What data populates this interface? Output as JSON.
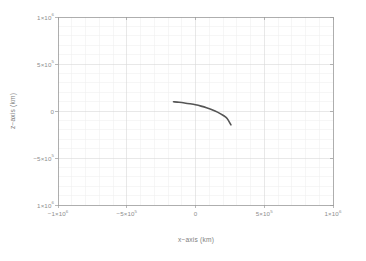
{
  "chart_data": {
    "type": "line",
    "title": "",
    "xlabel": "x−axis (km)",
    "ylabel": "z−axis (km)",
    "xlim": [
      -1000000,
      1000000
    ],
    "ylim": [
      -1000000,
      1000000
    ],
    "grid": true,
    "legend": null,
    "xticks": [
      {
        "value": -1000000,
        "mantissa": "−1×10",
        "exponent": "6",
        "label": "−1×10⁶"
      },
      {
        "value": -500000,
        "mantissa": "−5×10",
        "exponent": "5",
        "label": "−5×10⁵"
      },
      {
        "value": 0,
        "mantissa": "0",
        "exponent": "",
        "label": "0"
      },
      {
        "value": 500000,
        "mantissa": "5×10",
        "exponent": "5",
        "label": "5×10⁵"
      },
      {
        "value": 1000000,
        "mantissa": "1×10",
        "exponent": "6",
        "label": "1×10⁶"
      }
    ],
    "yticks": [
      {
        "value": 1000000,
        "mantissa": "1×10",
        "exponent": "6",
        "label": "1×10⁶"
      },
      {
        "value": 500000,
        "mantissa": "5×10",
        "exponent": "5",
        "label": "5×10⁵"
      },
      {
        "value": 0,
        "mantissa": "0",
        "exponent": "",
        "label": "0"
      },
      {
        "value": -500000,
        "mantissa": "−5×10",
        "exponent": "5",
        "label": "−5×10⁵"
      },
      {
        "value": -1000000,
        "mantissa": "1×10",
        "exponent": "6",
        "label": "1×10⁶"
      }
    ],
    "minor_ticks_per_major": 5,
    "series": [
      {
        "name": "trajectory",
        "color": "#555555",
        "linewidth": 1.6,
        "x": [
          -160000,
          -120000,
          -80000,
          -40000,
          0,
          40000,
          80000,
          120000,
          160000,
          200000,
          230000,
          258000
        ],
        "y": [
          98000,
          93000,
          86000,
          77000,
          66000,
          52000,
          35000,
          14000,
          -12000,
          -45000,
          -80000,
          -148000
        ]
      }
    ]
  },
  "axes": {
    "x_title": "x−axis (km)",
    "y_title": "z−axis (km)"
  },
  "colors": {
    "background": "#ffffff",
    "frame": "#9a9a9a",
    "major_grid": "#d8d8d8",
    "minor_grid": "#ededed",
    "curve": "#555555",
    "tick_text": "#8d8d8d"
  }
}
